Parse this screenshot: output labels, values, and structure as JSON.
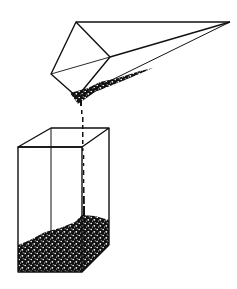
{
  "figure": {
    "colors": {
      "ink": "#111111",
      "background": "#ffffff"
    },
    "pyramid": {
      "base_vertices": [
        [
          76,
          22
        ],
        [
          110,
          57
        ],
        [
          75,
          97
        ],
        [
          51,
          74
        ]
      ],
      "apex": [
        230,
        22
      ],
      "diagonal": [
        [
          51,
          74
        ],
        [
          110,
          57
        ]
      ]
    },
    "box": {
      "top": [
        [
          51,
          128
        ],
        [
          109,
          128
        ],
        [
          82,
          147
        ],
        [
          18,
          147
        ]
      ],
      "front": {
        "x": 18,
        "y": 147,
        "w": 64,
        "h": 125
      },
      "back_right_bottom": [
        109,
        245
      ],
      "front_right_bottom": [
        82,
        272
      ]
    },
    "stream": {
      "from": [
        79,
        97
      ],
      "to": [
        82,
        222
      ]
    }
  }
}
